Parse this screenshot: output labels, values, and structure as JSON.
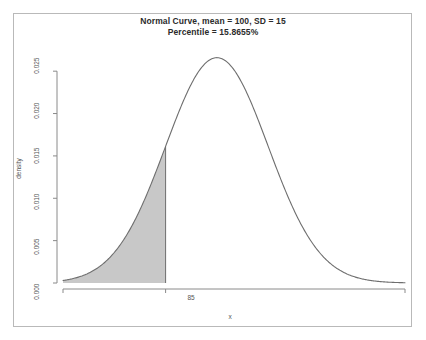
{
  "chart_data": {
    "type": "area",
    "title": "Normal Curve, mean = 100, SD = 15",
    "subtitle": "Percentile = 15.8655%",
    "xlabel": "x",
    "ylabel": "density",
    "distribution": {
      "name": "normal",
      "mean": 100,
      "sd": 15,
      "peak_density": 0.0265962
    },
    "shaded_region": {
      "label": "lower tail",
      "from": "-inf",
      "to": 85,
      "area": 0.158655,
      "area_percent": "15.8655%",
      "fill_color": "#c8c8c8"
    },
    "xlim": [
      55,
      155
    ],
    "ylim": [
      0,
      0.0275
    ],
    "xticks": [
      85
    ],
    "xtick_labels": [
      "85"
    ],
    "yticks": [
      0.0,
      0.005,
      0.01,
      0.015,
      0.02,
      0.025
    ],
    "ytick_labels": [
      "0.000",
      "0.005",
      "0.010",
      "0.015",
      "0.020",
      "0.025"
    ],
    "grid": false,
    "legend": "none",
    "curve_color": "#6e6e6e",
    "axis_color": "#8a8a8a",
    "x": [
      55,
      58,
      61,
      64,
      67,
      70,
      73,
      76,
      79,
      82,
      85,
      88,
      91,
      94,
      97,
      100,
      103,
      106,
      109,
      112,
      115,
      118,
      121,
      124,
      127,
      130,
      133,
      136,
      139,
      142,
      145,
      148,
      151,
      155
    ],
    "y": [
      1.52e-05,
      3.33e-05,
      6.93e-05,
      0.0001371,
      0.0002582,
      0.0004624,
      0.0007881,
      0.0012779,
      0.0019724,
      0.0028969,
      0.0040471,
      0.00538,
      0.0068108,
      0.0082224,
      0.009483,
      0.0106383,
      0.009483,
      0.0082224,
      0.0068108,
      0.00538,
      0.0040471,
      0.0028969,
      0.0019724,
      0.0012779,
      0.0007881,
      0.0004624,
      0.0002582,
      0.0001371,
      6.93e-05,
      3.33e-05,
      1.52e-05,
      6.6e-06,
      2.7e-06,
      9e-07
    ]
  },
  "plot": {
    "title": "Normal Curve, mean = 100, SD = 15",
    "subtitle": "Percentile = 15.8655%",
    "ylabel": "density",
    "xlabel": "x",
    "ytick_labels": [
      "0.025",
      "0.020",
      "0.015",
      "0.010",
      "0.005",
      "0.000"
    ],
    "xtick_labels": [
      "85"
    ]
  }
}
